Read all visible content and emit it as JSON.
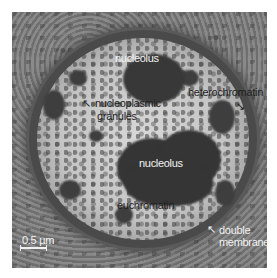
{
  "figure": {
    "labels": {
      "nucleolus_top": "nucleolus",
      "nucleolus_center": "nucleolus",
      "nucleoplasmic_granules_line1": "nucleoplasmic",
      "nucleoplasmic_granules_line2": "granules",
      "heterochromatin": "heterochromatin",
      "euchromatin": "euchromatin",
      "double_membrane_line1": "double",
      "double_membrane_line2": "membrane"
    },
    "scale_bar": {
      "label": "0.5 µm"
    },
    "colors": {
      "background": "#ffffff",
      "cytoplasm": "#7c7c7c",
      "heterochromatin": "#3e3e3e",
      "euchromatin": "#d0d0d0",
      "label_light": "#f2f2f2",
      "label_dark": "#1e1e1e"
    },
    "arrows": {
      "nucleoplasmic_granules": "↖",
      "heterochromatin": "↘",
      "double_membrane": "↖"
    }
  }
}
